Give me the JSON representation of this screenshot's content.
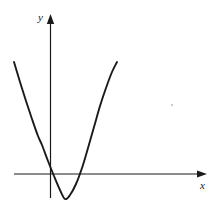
{
  "figure": {
    "background_color": "#ffffff",
    "curve_color": "#1a1a1a",
    "axis_color": "#1a1a1a",
    "label_color": "#1a1a1a",
    "artifact_color": "#b9b9b9",
    "axis_label_x": "x",
    "axis_label_y": "y"
  },
  "chart_data": {
    "type": "line",
    "title": "",
    "xlabel": "x",
    "ylabel": "y",
    "grid": false,
    "legend": null,
    "annotations": [],
    "axes": {
      "x_axis_pixel_y": 174,
      "y_axis_pixel_x": 50,
      "x_axis_pixel_span": [
        14,
        207
      ],
      "y_axis_pixel_span": [
        15,
        198
      ],
      "x_arrow_at": "right",
      "y_arrow_at": "top",
      "origin_pixel": [
        50,
        174
      ]
    },
    "series": [
      {
        "name": "parabola",
        "shape": "upward parabola",
        "vertex_pixel": [
          65,
          199
        ],
        "x_intercepts_pixel": [
          42,
          88
        ],
        "endpoints_pixel": [
          [
            14,
            62
          ],
          [
            117,
            62
          ]
        ],
        "x": [
          14,
          20,
          26,
          32,
          38,
          42,
          48,
          54,
          60,
          65,
          70,
          76,
          82,
          88,
          94,
          100,
          106,
          112,
          117
        ],
        "values": [
          62,
          82,
          101,
          119,
          136,
          145,
          161,
          176,
          190,
          199,
          195,
          184,
          168,
          148,
          127,
          106,
          88,
          72,
          62
        ]
      }
    ],
    "xlim": [
      14,
      117
    ],
    "ylim": [
      62,
      199
    ]
  }
}
